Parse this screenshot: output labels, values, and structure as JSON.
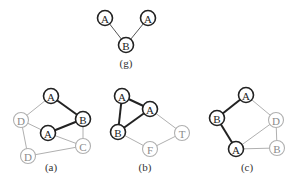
{
  "colors": {
    "dark": "#222222",
    "light": "#b0b0b0",
    "background": "#ffffff"
  },
  "graphs": [
    {
      "id": "g",
      "label": "(g)",
      "label_pos": [
        126,
        63
      ],
      "nodes": [
        {
          "label": "A",
          "x": 105,
          "y": 18,
          "style": "dark"
        },
        {
          "label": "A",
          "x": 148,
          "y": 18,
          "style": "dark"
        },
        {
          "label": "B",
          "x": 126,
          "y": 45,
          "style": "dark"
        }
      ],
      "edges": [
        {
          "from": 0,
          "to": 2,
          "style": "thin-dark"
        },
        {
          "from": 1,
          "to": 2,
          "style": "thin-dark"
        }
      ]
    },
    {
      "id": "a",
      "label": "(a)",
      "label_pos": [
        51,
        167
      ],
      "nodes": [
        {
          "label": "A",
          "x": 51,
          "y": 96,
          "style": "dark"
        },
        {
          "label": "D",
          "x": 21,
          "y": 120,
          "style": "light"
        },
        {
          "label": "B",
          "x": 83,
          "y": 119,
          "style": "dark"
        },
        {
          "label": "A",
          "x": 48,
          "y": 133,
          "style": "dark"
        },
        {
          "label": "C",
          "x": 83,
          "y": 146,
          "style": "light"
        },
        {
          "label": "D",
          "x": 28,
          "y": 156,
          "style": "light"
        }
      ],
      "edges": [
        {
          "from": 0,
          "to": 2,
          "style": "dark"
        },
        {
          "from": 2,
          "to": 3,
          "style": "dark"
        },
        {
          "from": 0,
          "to": 1,
          "style": "light"
        },
        {
          "from": 1,
          "to": 3,
          "style": "light"
        },
        {
          "from": 1,
          "to": 5,
          "style": "light"
        },
        {
          "from": 3,
          "to": 4,
          "style": "light"
        },
        {
          "from": 2,
          "to": 4,
          "style": "light"
        },
        {
          "from": 5,
          "to": 4,
          "style": "light"
        }
      ]
    },
    {
      "id": "b",
      "label": "(b)",
      "label_pos": [
        145,
        167
      ],
      "nodes": [
        {
          "label": "A",
          "x": 122,
          "y": 96,
          "style": "dark"
        },
        {
          "label": "A",
          "x": 150,
          "y": 109,
          "style": "dark"
        },
        {
          "label": "B",
          "x": 118,
          "y": 132,
          "style": "dark"
        },
        {
          "label": "T",
          "x": 182,
          "y": 133,
          "style": "light"
        },
        {
          "label": "F",
          "x": 150,
          "y": 149,
          "style": "light"
        }
      ],
      "edges": [
        {
          "from": 0,
          "to": 1,
          "style": "dark"
        },
        {
          "from": 0,
          "to": 2,
          "style": "dark"
        },
        {
          "from": 1,
          "to": 2,
          "style": "dark"
        },
        {
          "from": 1,
          "to": 3,
          "style": "light"
        },
        {
          "from": 2,
          "to": 4,
          "style": "light"
        },
        {
          "from": 4,
          "to": 3,
          "style": "light"
        }
      ]
    },
    {
      "id": "c",
      "label": "(c)",
      "label_pos": [
        247,
        167
      ],
      "nodes": [
        {
          "label": "A",
          "x": 246,
          "y": 95,
          "style": "dark"
        },
        {
          "label": "B",
          "x": 217,
          "y": 118,
          "style": "dark"
        },
        {
          "label": "D",
          "x": 276,
          "y": 120,
          "style": "light"
        },
        {
          "label": "A",
          "x": 236,
          "y": 149,
          "style": "dark"
        },
        {
          "label": "B",
          "x": 277,
          "y": 148,
          "style": "light"
        }
      ],
      "edges": [
        {
          "from": 0,
          "to": 1,
          "style": "dark"
        },
        {
          "from": 1,
          "to": 3,
          "style": "dark"
        },
        {
          "from": 0,
          "to": 2,
          "style": "light"
        },
        {
          "from": 3,
          "to": 2,
          "style": "light"
        },
        {
          "from": 2,
          "to": 4,
          "style": "light"
        },
        {
          "from": 3,
          "to": 4,
          "style": "light"
        }
      ]
    }
  ]
}
